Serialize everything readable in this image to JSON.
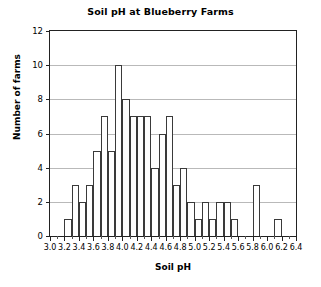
{
  "chart_data": {
    "type": "bar",
    "title": "Soil pH at Blueberry Farms",
    "xlabel": "Soil pH",
    "ylabel": "Number of farms",
    "xlim": [
      3.0,
      6.4
    ],
    "ylim": [
      0,
      12
    ],
    "bin_width": 0.1,
    "grid": true,
    "legend": null,
    "y_ticks": [
      0,
      2,
      4,
      6,
      8,
      10,
      12
    ],
    "y_tick_labels": [
      "0",
      "2",
      "4",
      "6",
      "8",
      "10",
      "12"
    ],
    "x_ticks": [
      3.0,
      3.2,
      3.4,
      3.6,
      3.8,
      4.0,
      4.2,
      4.4,
      4.6,
      4.8,
      5.0,
      5.2,
      5.4,
      5.6,
      5.8,
      6.0,
      6.2,
      6.4
    ],
    "x_tick_labels": [
      "3.0",
      "3.2",
      "3.4",
      "3.6",
      "3.8",
      "4.0",
      "4.2",
      "4.4",
      "4.6",
      "4.8",
      "5.0",
      "5.2",
      "5.4",
      "5.6",
      "5.8",
      "6.0",
      "6.2",
      "6.4"
    ],
    "x_minor_tick_step": 0.1,
    "bar_edge_color": "#3a3a3a",
    "bar_fill_color": "#ffffff",
    "grid_color": "#b9b9b9",
    "axis_color": "#222222",
    "bins": [
      {
        "start": 3.0,
        "end": 3.1,
        "value": 0
      },
      {
        "start": 3.1,
        "end": 3.2,
        "value": 0
      },
      {
        "start": 3.2,
        "end": 3.3,
        "value": 1
      },
      {
        "start": 3.3,
        "end": 3.4,
        "value": 3
      },
      {
        "start": 3.4,
        "end": 3.5,
        "value": 2
      },
      {
        "start": 3.5,
        "end": 3.6,
        "value": 3
      },
      {
        "start": 3.6,
        "end": 3.7,
        "value": 5
      },
      {
        "start": 3.7,
        "end": 3.8,
        "value": 7
      },
      {
        "start": 3.8,
        "end": 3.9,
        "value": 5
      },
      {
        "start": 3.9,
        "end": 4.0,
        "value": 10
      },
      {
        "start": 4.0,
        "end": 4.1,
        "value": 8
      },
      {
        "start": 4.1,
        "end": 4.2,
        "value": 7
      },
      {
        "start": 4.2,
        "end": 4.3,
        "value": 7
      },
      {
        "start": 4.3,
        "end": 4.4,
        "value": 7
      },
      {
        "start": 4.4,
        "end": 4.5,
        "value": 4
      },
      {
        "start": 4.5,
        "end": 4.6,
        "value": 6
      },
      {
        "start": 4.6,
        "end": 4.7,
        "value": 7
      },
      {
        "start": 4.7,
        "end": 4.8,
        "value": 3
      },
      {
        "start": 4.8,
        "end": 4.9,
        "value": 4
      },
      {
        "start": 4.9,
        "end": 5.0,
        "value": 2
      },
      {
        "start": 5.0,
        "end": 5.1,
        "value": 1
      },
      {
        "start": 5.1,
        "end": 5.2,
        "value": 2
      },
      {
        "start": 5.2,
        "end": 5.3,
        "value": 1
      },
      {
        "start": 5.3,
        "end": 5.4,
        "value": 2
      },
      {
        "start": 5.4,
        "end": 5.5,
        "value": 2
      },
      {
        "start": 5.5,
        "end": 5.6,
        "value": 1
      },
      {
        "start": 5.6,
        "end": 5.7,
        "value": 0
      },
      {
        "start": 5.7,
        "end": 5.8,
        "value": 0
      },
      {
        "start": 5.8,
        "end": 5.9,
        "value": 3
      },
      {
        "start": 5.9,
        "end": 6.0,
        "value": 0
      },
      {
        "start": 6.0,
        "end": 6.1,
        "value": 0
      },
      {
        "start": 6.1,
        "end": 6.2,
        "value": 1
      },
      {
        "start": 6.2,
        "end": 6.3,
        "value": 0
      },
      {
        "start": 6.3,
        "end": 6.4,
        "value": 0
      }
    ]
  }
}
